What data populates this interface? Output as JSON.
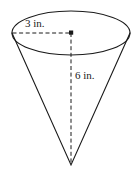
{
  "figure": {
    "name": "cone-diagram",
    "shape": "cone",
    "orientation": "apex-down",
    "background_color": "#ffffff",
    "stroke_color": "#1a1a1a"
  },
  "labels": {
    "radius": "3 in.",
    "height": "6 in."
  },
  "measurements": {
    "radius_value": 3,
    "radius_unit": "in.",
    "height_value": 6,
    "height_unit": "in."
  },
  "geometry": {
    "ellipse_center_x": 71,
    "ellipse_center_y": 33,
    "ellipse_rx": 59,
    "ellipse_ry": 22,
    "apex_x": 71,
    "apex_y": 165,
    "left_rim_x": 12,
    "left_rim_y": 33,
    "right_rim_x": 130,
    "right_rim_y": 33
  },
  "elements": {
    "center_dot": "center-point",
    "radius_line_style": "dashed",
    "height_line_style": "dashed",
    "outline_style": "solid"
  }
}
